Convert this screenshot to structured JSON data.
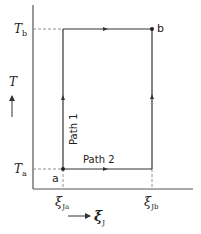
{
  "diagram": {
    "axes": {
      "y_label": "T",
      "x_label": "ξ",
      "x_label_sub": "J"
    },
    "y_ticks": [
      {
        "label": "T",
        "sub": "b"
      },
      {
        "label": "T",
        "sub": "a"
      }
    ],
    "x_ticks": [
      {
        "label": "ξ",
        "sub": "Ja"
      },
      {
        "label": "ξ",
        "sub": "Jb"
      }
    ],
    "points": {
      "start": "a",
      "end": "b"
    },
    "paths": [
      {
        "label": "Path 1",
        "route": "a → up at ξJa to Tb → right to b"
      },
      {
        "label": "Path 2",
        "route": "a → right at Ta to ξJb → up to b"
      }
    ],
    "colors": {
      "line": "#333333",
      "background": "#ffffff"
    }
  }
}
